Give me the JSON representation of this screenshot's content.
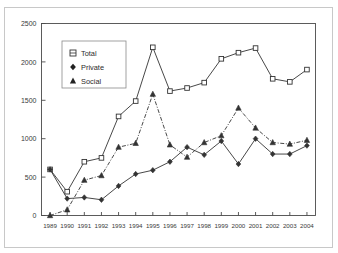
{
  "figure": {
    "title_ghost": "",
    "frame_color": "#c8c8c8",
    "axis_color": "#4a4a4a",
    "text_color": "#3a3a3a"
  },
  "legend": {
    "position": "top-left-inside",
    "entries": [
      {
        "label": "Total",
        "marker": "open-square",
        "line": "solid"
      },
      {
        "label": "Private",
        "marker": "filled-diamond",
        "line": "solid"
      },
      {
        "label": "Social",
        "marker": "filled-triangle",
        "line": "dash-dot"
      }
    ]
  },
  "axes": {
    "y_ticks": [
      "0",
      "500",
      "1000",
      "1500",
      "2000",
      "2500"
    ],
    "x_ticks": [
      "1989",
      "1990",
      "1991",
      "1992",
      "1993",
      "1994",
      "1995",
      "1996",
      "1997",
      "1998",
      "1999",
      "2000",
      "2001",
      "2002",
      "2003",
      "2004"
    ]
  },
  "chart_data": {
    "type": "line",
    "title": "",
    "subtitle": "",
    "xlabel": "",
    "ylabel": "",
    "xlim": [
      1989,
      2004
    ],
    "ylim": [
      0,
      2500
    ],
    "ytick_step": 500,
    "grid": false,
    "legend_position": "upper left (inside plot)",
    "x": [
      1989,
      1990,
      1991,
      1992,
      1993,
      1994,
      1995,
      1996,
      1997,
      1998,
      1999,
      2000,
      2001,
      2002,
      2003,
      2004
    ],
    "categories": [
      "1989",
      "1990",
      "1991",
      "1992",
      "1993",
      "1994",
      "1995",
      "1996",
      "1997",
      "1998",
      "1999",
      "2000",
      "2001",
      "2002",
      "2003",
      "2004"
    ],
    "series": [
      {
        "name": "Total",
        "marker": "open-square",
        "linestyle": "solid",
        "color": "#333333",
        "values": [
          600,
          310,
          700,
          750,
          1290,
          1490,
          2190,
          1620,
          1660,
          1730,
          2040,
          2120,
          2180,
          1780,
          1740,
          1900
        ]
      },
      {
        "name": "Private",
        "marker": "filled-diamond",
        "linestyle": "solid",
        "color": "#333333",
        "values": [
          600,
          220,
          235,
          205,
          385,
          540,
          590,
          700,
          890,
          790,
          970,
          670,
          1000,
          800,
          800,
          910
        ]
      },
      {
        "name": "Social",
        "marker": "filled-triangle",
        "linestyle": "dash-dot",
        "color": "#333333",
        "values": [
          0,
          75,
          460,
          520,
          890,
          940,
          1580,
          920,
          760,
          950,
          1040,
          1400,
          1140,
          950,
          930,
          980
        ]
      }
    ]
  }
}
